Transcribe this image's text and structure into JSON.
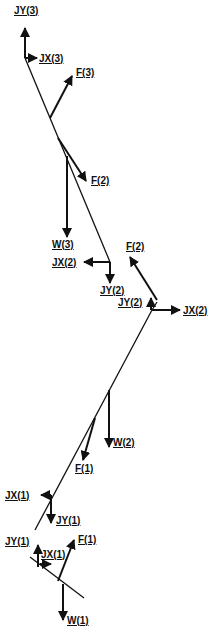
{
  "diagram": {
    "type": "free-body-diagram",
    "stroke_color": "#111111",
    "background": "#ffffff",
    "segments": [
      {
        "name": "segment-3",
        "line": [
          25,
          58,
          110,
          262
        ]
      },
      {
        "name": "segment-2",
        "line": [
          152,
          310,
          35,
          530
        ]
      },
      {
        "name": "segment-2-upper",
        "line": [
          157,
          302,
          152,
          310
        ]
      },
      {
        "name": "segment-1",
        "line": [
          30,
          557,
          84,
          598
        ]
      }
    ],
    "vectors": [
      {
        "id": "jy3",
        "label": "JY(3)",
        "from": [
          25,
          58
        ],
        "to": [
          25,
          28
        ],
        "label_pos": [
          14,
          14
        ]
      },
      {
        "id": "jx3",
        "label": "JX(3)",
        "from": [
          25,
          58
        ],
        "to": [
          37,
          58
        ],
        "label_pos": [
          39,
          62
        ]
      },
      {
        "id": "f3",
        "label": "F(3)",
        "from": [
          50,
          118
        ],
        "to": [
          72,
          76
        ],
        "label_pos": [
          76,
          76
        ]
      },
      {
        "id": "f2a",
        "label": "F(2)",
        "from": [
          58,
          138
        ],
        "to": [
          86,
          181
        ],
        "label_pos": [
          91,
          184
        ]
      },
      {
        "id": "w3",
        "label": "W(3)",
        "from": [
          67,
          156
        ],
        "to": [
          67,
          237
        ],
        "label_pos": [
          52,
          248
        ]
      },
      {
        "id": "jx2a",
        "label": "JX(2)",
        "from": [
          110,
          262
        ],
        "to": [
          84,
          262
        ],
        "label_pos": [
          52,
          266
        ]
      },
      {
        "id": "jy2a",
        "label": "JY(2)",
        "from": [
          110,
          262
        ],
        "to": [
          110,
          283
        ],
        "label_pos": [
          100,
          294
        ]
      },
      {
        "id": "f2b",
        "label": "F(2)",
        "from": [
          157,
          300
        ],
        "to": [
          130,
          257
        ],
        "label_pos": [
          126,
          250
        ]
      },
      {
        "id": "jy2b",
        "label": "JY(2)",
        "from": [
          151,
          310
        ],
        "to": [
          151,
          298
        ],
        "label_pos": [
          118,
          306
        ]
      },
      {
        "id": "jx2b",
        "label": "JX(2)",
        "from": [
          152,
          310
        ],
        "to": [
          180,
          310
        ],
        "label_pos": [
          183,
          314
        ]
      },
      {
        "id": "w2",
        "label": "W(2)",
        "from": [
          109,
          390
        ],
        "to": [
          109,
          447
        ],
        "label_pos": [
          113,
          446
        ]
      },
      {
        "id": "f1a",
        "label": "F(1)",
        "from": [
          95,
          418
        ],
        "to": [
          83,
          460
        ],
        "label_pos": [
          75,
          472
        ]
      },
      {
        "id": "jx1a",
        "label": "JX(1)",
        "from": [
          51,
          495
        ],
        "to": [
          41,
          495
        ],
        "label_pos": [
          5,
          499
        ]
      },
      {
        "id": "jy1a",
        "label": "JY(1)",
        "from": [
          51,
          495
        ],
        "to": [
          51,
          523
        ],
        "label_pos": [
          56,
          524
        ]
      },
      {
        "id": "jy1b",
        "label": "JY(1)",
        "from": [
          38,
          567
        ],
        "to": [
          38,
          545
        ],
        "label_pos": [
          5,
          545
        ]
      },
      {
        "id": "jx1b",
        "label": "JX(1)",
        "from": [
          40,
          564
        ],
        "to": [
          51,
          564
        ],
        "label_pos": [
          41,
          558
        ]
      },
      {
        "id": "f1b",
        "label": "F(1)",
        "from": [
          58,
          581
        ],
        "to": [
          74,
          540
        ],
        "label_pos": [
          78,
          543
        ]
      },
      {
        "id": "w1",
        "label": "W(1)",
        "from": [
          63,
          584
        ],
        "to": [
          63,
          620
        ],
        "label_pos": [
          67,
          624
        ]
      }
    ]
  }
}
